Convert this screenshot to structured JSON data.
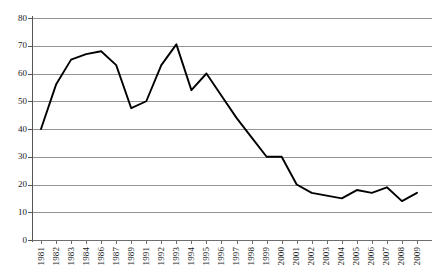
{
  "chart_data": {
    "type": "line",
    "title": "",
    "subtitle": "",
    "xlabel": "",
    "ylabel": "",
    "ylim": [
      0,
      80
    ],
    "ytick_step": 10,
    "yticks": [
      80,
      70,
      60,
      50,
      40,
      30,
      20,
      10,
      0
    ],
    "grid": true,
    "legend": false,
    "legend_position": "none",
    "series_color": "#000000",
    "gridline_color": "#939393",
    "axis_color": "#555555",
    "categories": [
      "1981",
      "1982",
      "1983",
      "1984",
      "1986",
      "1987",
      "1989",
      "1991",
      "1992",
      "1993",
      "1994",
      "1995",
      "1996",
      "1997",
      "1998",
      "1999",
      "2000",
      "2001",
      "2002",
      "2003",
      "2004",
      "2005",
      "2006",
      "2007",
      "2008",
      "2009"
    ],
    "values": [
      40,
      56,
      65,
      67,
      68,
      63,
      47.5,
      50,
      63,
      70.5,
      54,
      60,
      52,
      44,
      37,
      30,
      30,
      20,
      17,
      16,
      15,
      18,
      17,
      19,
      14,
      17
    ]
  }
}
